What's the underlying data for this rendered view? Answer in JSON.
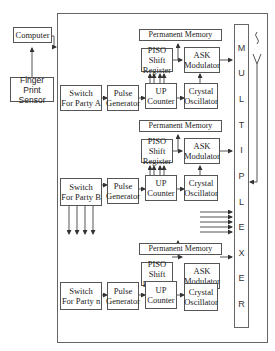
{
  "diagram": {
    "computer": "Computer",
    "fingerprint_sensor": [
      "Finger Print",
      "Sensor"
    ],
    "multiplexer_letters": [
      "M",
      "U",
      "L",
      "T",
      "I",
      "P",
      "L",
      "E",
      "X",
      "E",
      "R"
    ],
    "sections": [
      {
        "permanent_memory": "Permanent Memory",
        "piso": [
          "PISO Shift",
          "Register"
        ],
        "ask": [
          "ASK",
          "Modulator"
        ],
        "up_counter": [
          "UP",
          "Counter"
        ],
        "crystal": [
          "Crystal",
          "Oscillator"
        ],
        "switch": [
          "Switch",
          "For Party A"
        ],
        "pulse": [
          "Pulse",
          "Generator"
        ]
      },
      {
        "permanent_memory": "Permanent Memory",
        "piso": [
          "PISO Shift",
          "Register"
        ],
        "ask": [
          "ASK",
          "Modulator"
        ],
        "up_counter": [
          "UP",
          "Counter"
        ],
        "crystal": [
          "Crystal",
          "Oscillator"
        ],
        "switch": [
          "Switch",
          "For Party B"
        ],
        "pulse": [
          "Pulse",
          "Generator"
        ]
      },
      {
        "permanent_memory": "Permanent Memory",
        "piso": [
          "PISO Shift",
          "Register"
        ],
        "ask": [
          "ASK",
          "Modulator"
        ],
        "up_counter": [
          "UP",
          "Counter"
        ],
        "crystal": [
          "Crystal",
          "Oscillator"
        ],
        "switch": [
          "Switch",
          "For Party n"
        ],
        "pulse": [
          "Pulse",
          "Generator"
        ]
      }
    ],
    "colors": {
      "line": "#555555",
      "background": "#ffffff"
    }
  }
}
